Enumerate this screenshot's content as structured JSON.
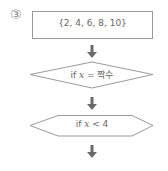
{
  "diagram": {
    "step_number": "③",
    "start_box": {
      "text": "{2, 4, 6, 8, 10}"
    },
    "decision_1": {
      "prefix": "if ",
      "var": "x",
      "op": " = ",
      "value": "짝수"
    },
    "decision_2": {
      "prefix": "if ",
      "var": "x",
      "op": " < ",
      "value": "4"
    },
    "stroke_color": "#9a9a9a",
    "arrow_color": "#6a6a6a"
  }
}
